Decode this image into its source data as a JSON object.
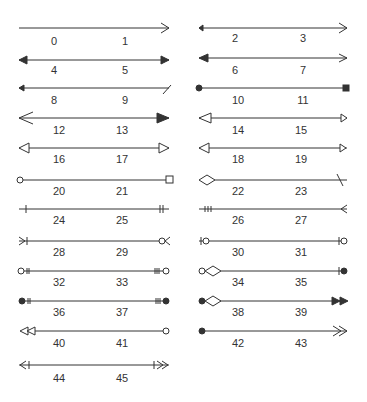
{
  "line_color": "#333333",
  "columns": {
    "left": {
      "x1": 19,
      "x2": 169
    },
    "right": {
      "x1": 199,
      "x2": 347
    }
  },
  "items": [
    {
      "col": "left",
      "y": 28,
      "labels": [
        "0",
        "1"
      ],
      "start": "none",
      "end": "open"
    },
    {
      "col": "right",
      "y": 28,
      "labels": [
        "2",
        "3"
      ],
      "start": "small-filled",
      "end": "open"
    },
    {
      "col": "left",
      "y": 60,
      "labels": [
        "4",
        "5"
      ],
      "start": "filled",
      "end": "filled"
    },
    {
      "col": "right",
      "y": 60,
      "labels": [
        "6",
        "7"
      ],
      "start": "filled-large",
      "end": "open"
    },
    {
      "col": "left",
      "y": 88,
      "labels": [
        "8",
        "9"
      ],
      "start": "small-filled",
      "end": "half-slash"
    },
    {
      "col": "right",
      "y": 88,
      "labels": [
        "10",
        "11"
      ],
      "start": "dot",
      "end": "square-filled"
    },
    {
      "col": "left",
      "y": 118,
      "labels": [
        "12",
        "13"
      ],
      "start": "open-large",
      "end": "filled-large"
    },
    {
      "col": "right",
      "y": 118,
      "labels": [
        "14",
        "15"
      ],
      "start": "hollow-triangle",
      "end": "hollow-triangle-small"
    },
    {
      "col": "left",
      "y": 148,
      "labels": [
        "16",
        "17"
      ],
      "start": "hollow-triangle",
      "end": "hollow-triangle"
    },
    {
      "col": "right",
      "y": 148,
      "labels": [
        "18",
        "19"
      ],
      "start": "hollow-triangle",
      "end": "hollow-triangle-inset"
    },
    {
      "col": "left",
      "y": 180,
      "labels": [
        "20",
        "21"
      ],
      "start": "circle-hollow",
      "end": "square-hollow"
    },
    {
      "col": "right",
      "y": 180,
      "labels": [
        "22",
        "23"
      ],
      "start": "diamond-hollow",
      "end": "slash"
    },
    {
      "col": "left",
      "y": 209,
      "labels": [
        "24",
        "25"
      ],
      "start": "bar",
      "end": "double-bar"
    },
    {
      "col": "right",
      "y": 209,
      "labels": [
        "26",
        "27"
      ],
      "start": "triple-bar",
      "end": "crow-foot"
    },
    {
      "col": "left",
      "y": 241,
      "labels": [
        "28",
        "29"
      ],
      "start": "crow-foot-bar",
      "end": "circle-crow-foot"
    },
    {
      "col": "right",
      "y": 241,
      "labels": [
        "30",
        "31"
      ],
      "start": "bar-circle",
      "end": "bar-circle"
    },
    {
      "col": "left",
      "y": 271,
      "labels": [
        "32",
        "33"
      ],
      "start": "circle-double-bar",
      "end": "triple-bar-circle"
    },
    {
      "col": "right",
      "y": 271,
      "labels": [
        "34",
        "35"
      ],
      "start": "circle-diamond",
      "end": "bar-dot"
    },
    {
      "col": "left",
      "y": 301,
      "labels": [
        "36",
        "37"
      ],
      "start": "dot-double-bar",
      "end": "triple-bar-dot"
    },
    {
      "col": "right",
      "y": 301,
      "labels": [
        "38",
        "39"
      ],
      "start": "dot-diamond",
      "end": "double-filled"
    },
    {
      "col": "left",
      "y": 331,
      "labels": [
        "40",
        "41"
      ],
      "start": "double-hollow-triangle",
      "end": "circle-hollow"
    },
    {
      "col": "right",
      "y": 331,
      "labels": [
        "42",
        "43"
      ],
      "start": "dot",
      "end": "double-open"
    },
    {
      "col": "left",
      "y": 365,
      "labels": [
        "44",
        "45"
      ],
      "start": "open-bar",
      "end": "bar-double-open"
    }
  ],
  "labels": {
    "l0": "0",
    "l1": "1",
    "l2": "2",
    "l3": "3",
    "l4": "4",
    "l5": "5",
    "l6": "6",
    "l7": "7",
    "l8": "8",
    "l9": "9",
    "l10": "10",
    "l11": "11",
    "l12": "12",
    "l13": "13",
    "l14": "14",
    "l15": "15",
    "l16": "16",
    "l17": "17",
    "l18": "18",
    "l19": "19",
    "l20": "20",
    "l21": "21",
    "l22": "22",
    "l23": "23",
    "l24": "24",
    "l25": "25",
    "l26": "26",
    "l27": "27",
    "l28": "28",
    "l29": "29",
    "l30": "30",
    "l31": "31",
    "l32": "32",
    "l33": "33",
    "l34": "34",
    "l35": "35",
    "l36": "36",
    "l37": "37",
    "l38": "38",
    "l39": "39",
    "l40": "40",
    "l41": "41",
    "l42": "42",
    "l43": "43",
    "l44": "44",
    "l45": "45"
  }
}
